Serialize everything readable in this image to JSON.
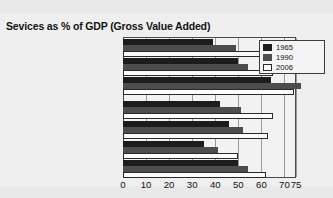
{
  "chart_data": {
    "type": "bar",
    "orientation": "horizontal",
    "title": "Sevices as % of GDP (Gross Value Added)",
    "xlabel": "",
    "ylabel": "",
    "xlim": [
      0,
      75
    ],
    "xticks": [
      0,
      10,
      20,
      30,
      40,
      50,
      60,
      70,
      75
    ],
    "grid": true,
    "legend_position": "top-right",
    "categories": [
      "Low income countries",
      "Middle income countries",
      "High income countries",
      "South Asia",
      "Sub-Saharan Africa",
      "East Asia and Pacific",
      "Latin America and the Caribbean"
    ],
    "series": [
      {
        "name": "1965",
        "color": "#1c1c1c",
        "values": [
          39,
          50,
          64,
          42,
          46,
          35,
          50
        ]
      },
      {
        "name": "1990",
        "color": "#4d4d4d",
        "values": [
          49,
          54,
          77,
          51,
          52,
          41,
          54
        ]
      },
      {
        "name": "2006",
        "color": "#ffffff",
        "values": [
          63,
          65,
          74,
          65,
          63,
          50,
          62
        ]
      }
    ]
  },
  "legend": {
    "entries": [
      {
        "label": "1965",
        "swatch": "s1965"
      },
      {
        "label": "1990",
        "swatch": "s1990"
      },
      {
        "label": "2006",
        "swatch": "s2006"
      }
    ]
  }
}
